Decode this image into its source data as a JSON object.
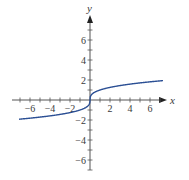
{
  "chart_data": {
    "type": "line",
    "title": "",
    "xlabel": "x",
    "ylabel": "y",
    "xlim": [
      -7.8,
      7.6
    ],
    "ylim": [
      -7,
      8.5
    ],
    "grid": false,
    "legend": null,
    "x_ticks": [
      -6,
      -4,
      -2,
      2,
      4,
      6
    ],
    "y_ticks": [
      -6,
      -4,
      -2,
      2,
      4,
      6
    ],
    "x_tick_labels": [
      "−6",
      "−4",
      "−2",
      "2",
      "4",
      "6"
    ],
    "y_tick_labels": [
      "6",
      "4",
      "2",
      "−2",
      "−4",
      "−6"
    ],
    "series": [
      {
        "name": "y = cube root of x",
        "color": "#2b4f94",
        "domain": [
          -7.1,
          7.3
        ],
        "x": [
          -7,
          -6,
          -5,
          -4,
          -3,
          -2,
          -1,
          -0.5,
          -0.1,
          0,
          0.1,
          0.5,
          1,
          2,
          3,
          4,
          5,
          6,
          7
        ],
        "y": [
          -1.91,
          -1.82,
          -1.71,
          -1.59,
          -1.44,
          -1.26,
          -1.0,
          -0.79,
          -0.46,
          0,
          0.46,
          0.79,
          1.0,
          1.26,
          1.44,
          1.59,
          1.71,
          1.82,
          1.91
        ]
      }
    ]
  },
  "labels": {
    "x_axis": "x",
    "y_axis": "y"
  }
}
